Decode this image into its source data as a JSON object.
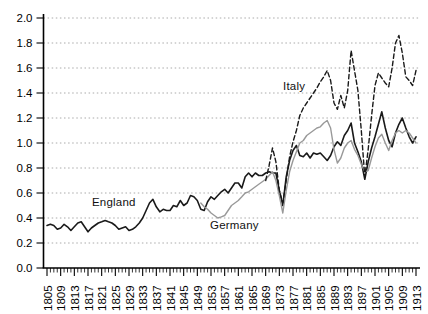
{
  "figure": {
    "labels": {
      "england": "England",
      "germany": "Germany",
      "italy": "Italy"
    },
    "colors": {
      "england": "#1a1a1a",
      "germany": "#999999",
      "italy": "#1a1a1a",
      "axis": "#000000",
      "gridline": "#aaaaaa",
      "background": "#ffffff"
    }
  },
  "chart_data": {
    "type": "line",
    "title": "",
    "xlabel": "",
    "ylabel": "",
    "x_range": [
      1805,
      1913
    ],
    "ylim": [
      0.0,
      2.0
    ],
    "y_ticks": [
      "0.0",
      "0.2",
      "0.4",
      "0.6",
      "0.8",
      "1.0",
      "1.2",
      "1.4",
      "1.6",
      "1.8",
      "2.0"
    ],
    "x_tick_labels": [
      1805,
      1809,
      1813,
      1817,
      1821,
      1825,
      1829,
      1833,
      1837,
      1841,
      1845,
      1849,
      1853,
      1857,
      1861,
      1865,
      1869,
      1873,
      1877,
      1881,
      1885,
      1889,
      1893,
      1897,
      1901,
      1905,
      1909,
      1913
    ],
    "x_minor_tick_every_years": 1,
    "grid": "horizontal-dotted",
    "legend_position": "inline-annotations",
    "annotations": [
      {
        "text": "England",
        "near_year": 1822,
        "near_value": 0.5
      },
      {
        "text": "Germany",
        "near_year": 1856,
        "near_value": 0.3
      },
      {
        "text": "Italy",
        "near_year": 1875,
        "near_value": 1.48
      }
    ],
    "series": [
      {
        "name": "England",
        "style": "solid",
        "color": "#1a1a1a",
        "start_year": 1805,
        "values": [
          0.34,
          0.35,
          0.34,
          0.31,
          0.32,
          0.35,
          0.33,
          0.3,
          0.33,
          0.36,
          0.37,
          0.33,
          0.29,
          0.32,
          0.34,
          0.36,
          0.37,
          0.38,
          0.37,
          0.36,
          0.34,
          0.31,
          0.32,
          0.33,
          0.3,
          0.31,
          0.33,
          0.36,
          0.4,
          0.46,
          0.52,
          0.55,
          0.49,
          0.45,
          0.47,
          0.46,
          0.46,
          0.5,
          0.49,
          0.54,
          0.5,
          0.52,
          0.58,
          0.57,
          0.54,
          0.47,
          0.46,
          0.53,
          0.57,
          0.55,
          0.58,
          0.61,
          0.63,
          0.6,
          0.64,
          0.68,
          0.68,
          0.64,
          0.73,
          0.76,
          0.73,
          0.76,
          0.74,
          0.74,
          0.76,
          0.77,
          0.76,
          0.76,
          0.62,
          0.5,
          0.73,
          0.86,
          0.94,
          0.98,
          0.9,
          0.89,
          0.92,
          0.88,
          0.92,
          0.91,
          0.92,
          0.89,
          0.86,
          0.9,
          0.97,
          1.01,
          0.98,
          1.06,
          1.1,
          1.16,
          1.0,
          0.93,
          0.85,
          0.71,
          0.85,
          0.96,
          1.05,
          1.15,
          1.25,
          1.12,
          1.02,
          0.97,
          1.08,
          1.15,
          1.2,
          1.12,
          1.05,
          1.0,
          1.05
        ]
      },
      {
        "name": "Germany",
        "style": "solid",
        "color": "#999999",
        "start_year": 1850,
        "values": [
          0.52,
          0.49,
          0.47,
          0.44,
          0.42,
          0.4,
          0.41,
          0.42,
          0.46,
          0.5,
          0.52,
          0.54,
          0.57,
          0.6,
          0.61,
          0.63,
          0.65,
          0.67,
          0.69,
          0.71,
          0.74,
          0.77,
          0.7,
          0.58,
          0.44,
          0.62,
          0.77,
          0.86,
          0.93,
          1.0,
          1.02,
          1.06,
          1.08,
          1.1,
          1.12,
          1.13,
          1.16,
          1.18,
          1.12,
          0.95,
          0.84,
          0.88,
          0.96,
          1.0,
          1.02,
          0.95,
          0.9,
          0.83,
          0.77,
          0.78,
          0.88,
          0.97,
          1.04,
          1.07,
          1.0,
          0.94,
          1.02,
          1.08,
          1.1,
          1.08,
          1.1,
          1.08,
          1.04,
          1.0
        ]
      },
      {
        "name": "Italy",
        "style": "dashed",
        "color": "#1a1a1a",
        "start_year": 1869,
        "values": [
          0.7,
          0.82,
          0.96,
          0.85,
          0.62,
          0.52,
          0.7,
          0.89,
          1.01,
          1.1,
          1.22,
          1.28,
          1.32,
          1.36,
          1.4,
          1.44,
          1.49,
          1.53,
          1.58,
          1.5,
          1.32,
          1.27,
          1.38,
          1.28,
          1.42,
          1.74,
          1.58,
          1.42,
          1.1,
          0.73,
          0.95,
          1.22,
          1.46,
          1.56,
          1.52,
          1.48,
          1.45,
          1.6,
          1.8,
          1.86,
          1.72,
          1.53,
          1.5,
          1.46,
          1.58
        ]
      }
    ]
  }
}
